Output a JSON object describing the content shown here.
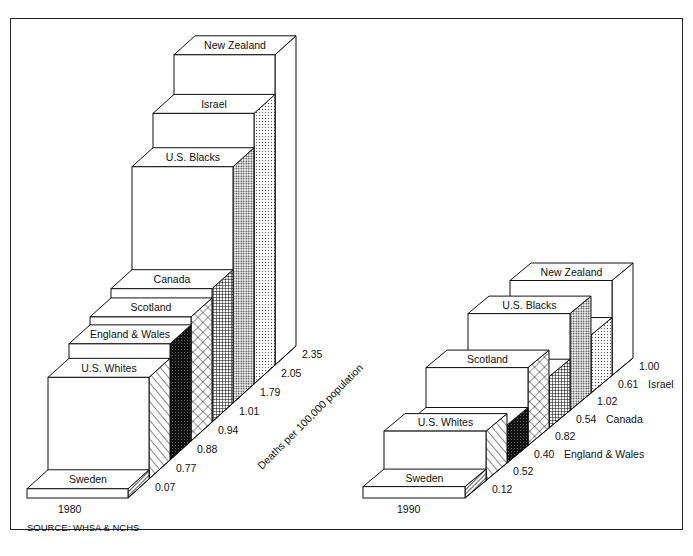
{
  "chart_data": [
    {
      "type": "bar",
      "title": "1980",
      "ylabel": "Deaths per 100,000 population",
      "categories": [
        "Sweden",
        "U.S. Whites",
        "England & Wales",
        "Scotland",
        "Canada",
        "U.S. Blacks",
        "Israel",
        "New Zealand"
      ],
      "values": [
        0.07,
        0.77,
        0.88,
        0.94,
        1.01,
        1.79,
        2.05,
        2.35
      ],
      "value_labels": [
        "0.07",
        "0.77",
        "0.88",
        "0.94",
        "1.01",
        "1.79",
        "2.05",
        "2.35"
      ],
      "style": "3d-stepped",
      "grid": false
    },
    {
      "type": "bar",
      "title": "1990",
      "ylabel": "Deaths per 100,000 population",
      "categories": [
        "Sweden",
        "U.S. Whites",
        "England & Wales",
        "Scotland",
        "Canada",
        "U.S. Blacks",
        "Israel",
        "New Zealand"
      ],
      "values": [
        0.12,
        0.52,
        0.4,
        0.82,
        0.54,
        1.02,
        0.61,
        1.0
      ],
      "value_labels": [
        "0.12",
        "0.52",
        "0.40",
        "0.82",
        "0.54",
        "1.02",
        "0.61",
        "1.00"
      ],
      "side_labels": [
        "",
        "",
        "England & Wales",
        "",
        "Canada",
        "",
        "Israel",
        ""
      ],
      "front_labels": [
        "Sweden",
        "U.S. Whites",
        "",
        "Scotland",
        "",
        "U.S. Blacks",
        "",
        "New Zealand"
      ],
      "style": "3d-stepped",
      "grid": false
    }
  ],
  "patterns": [
    "diag-fine",
    "diag-wide",
    "solid-dark",
    "crosshatch-diamond",
    "grid-fine",
    "dots-dense",
    "dots-light",
    "plain"
  ],
  "axis_label": "Deaths per 100,000 population",
  "years": {
    "left": "1980",
    "right": "1990"
  },
  "source": "SOURCE:  WHSA & NCHS"
}
